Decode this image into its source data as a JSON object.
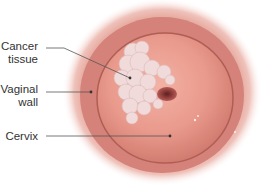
{
  "diagram": {
    "labels": [
      {
        "id": "cancer-tissue",
        "line1": "Cancer",
        "line2": "tissue"
      },
      {
        "id": "vaginal-wall",
        "line1": "Vaginal",
        "line2": "wall"
      },
      {
        "id": "cervix",
        "line1": "Cervix"
      }
    ],
    "colors": {
      "outer_glow": "#e9a99e",
      "wall": "#d7847a",
      "cervix": "#e99a8c",
      "cancer": "#f1dcdc",
      "os": "#7a2a2a",
      "leader_line": "#555555"
    }
  }
}
